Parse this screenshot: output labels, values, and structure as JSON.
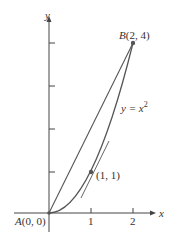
{
  "figure": {
    "axes": {
      "x_label": "x",
      "y_label": "y",
      "x_ticks": [
        "1",
        "2"
      ],
      "y_tick_count": 4
    },
    "points": {
      "A": {
        "label_letter": "A",
        "label_coords": "(0, 0)",
        "x": 0,
        "y": 0
      },
      "B": {
        "label_letter": "B",
        "label_coords": "(2, 4)",
        "x": 2,
        "y": 4
      },
      "P": {
        "label": "(1, 1)",
        "x": 1,
        "y": 1
      }
    },
    "curve": {
      "label_lhs": "y = ",
      "label_base": "x",
      "label_exp": "2",
      "equation": "y = x^2"
    },
    "chord": {
      "from": "A",
      "to": "B"
    },
    "tangent": {
      "at": "P",
      "slope": 2
    },
    "colors": {
      "curve": "#555555",
      "axes": "#444444",
      "points": "#555555",
      "text": "#333333"
    }
  }
}
